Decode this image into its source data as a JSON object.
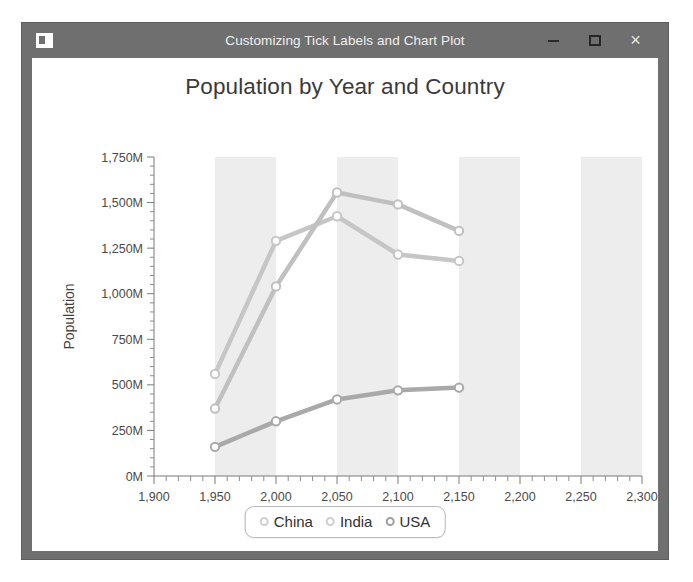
{
  "window": {
    "title": "Customizing Tick Labels and Chart Plot",
    "icon": "app-icon",
    "controls": {
      "minimize": "–",
      "maximize": "□",
      "close": "×"
    },
    "frame_color": "#6f6f6f",
    "client_color": "#ffffff"
  },
  "chart_data": {
    "type": "line",
    "title": "Population by Year and Country",
    "xlabel": "Year",
    "ylabel": "Population",
    "xlim": [
      1900,
      2300
    ],
    "ylim": [
      0,
      1750
    ],
    "xticks": [
      1900,
      1950,
      2000,
      2050,
      2100,
      2150,
      2200,
      2250,
      2300
    ],
    "xticklabels": [
      "1,900",
      "1,950",
      "2,000",
      "2,050",
      "2,100",
      "2,150",
      "2,200",
      "2,250",
      "2,300"
    ],
    "yticks": [
      0,
      250,
      500,
      750,
      1000,
      1250,
      1500,
      1750
    ],
    "yticklabels": [
      "0M",
      "250M",
      "500M",
      "750M",
      "1,000M",
      "1,250M",
      "1,500M",
      "1,750M"
    ],
    "x": [
      1950,
      2000,
      2050,
      2100,
      2150
    ],
    "minor_ticks": true,
    "grid": false,
    "band_shading": true,
    "band_color": "#ededed",
    "plot_background": "#ffffff",
    "legend_position": "bottom",
    "marker": "circle-open",
    "series": [
      {
        "name": "China",
        "color": "#c6c6c6",
        "values": [
          560,
          1290,
          1425,
          1215,
          1180
        ]
      },
      {
        "name": "India",
        "color": "#c0c0c0",
        "values": [
          370,
          1040,
          1555,
          1490,
          1345
        ]
      },
      {
        "name": "USA",
        "color": "#a9a9a9",
        "values": [
          160,
          300,
          420,
          470,
          485
        ]
      }
    ]
  },
  "legend": {
    "items": [
      {
        "label": "China",
        "marker_color": "#cfcfcf"
      },
      {
        "label": "India",
        "marker_color": "#cfcfcf"
      },
      {
        "label": "USA",
        "marker_color": "#9f9f9f"
      }
    ]
  }
}
